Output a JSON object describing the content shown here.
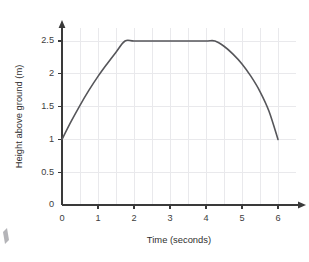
{
  "chart_data": {
    "type": "line",
    "title": "",
    "xlabel": "Time (seconds)",
    "ylabel": "Height above ground (m)",
    "xlim": [
      0,
      6.5
    ],
    "ylim": [
      0,
      2.7
    ],
    "grid": true,
    "legend": false,
    "x_ticks": [
      0,
      1,
      2,
      3,
      4,
      5,
      6
    ],
    "x_tick_labels": [
      "0",
      "1",
      "2",
      "3",
      "4",
      "5",
      "6"
    ],
    "y_ticks": [
      0,
      0.5,
      1,
      1.5,
      2,
      2.5
    ],
    "y_tick_labels": [
      "0",
      "0.5",
      "1",
      "1.5",
      "2",
      "2.5"
    ],
    "x_gridlines": [
      0.5,
      1,
      1.5,
      2,
      2.5,
      3,
      3.5,
      4,
      4.5,
      5,
      5.5,
      6
    ],
    "y_gridlines": [
      0.5,
      1,
      1.5,
      2,
      2.5
    ],
    "series": [
      {
        "name": "Height above ground",
        "color": "#56565a",
        "x": [
          0,
          0.25,
          0.5,
          0.75,
          1.0,
          1.25,
          1.5,
          1.75,
          2.0,
          2.5,
          3.0,
          3.5,
          4.0,
          4.25,
          4.5,
          4.75,
          5.0,
          5.25,
          5.5,
          5.75,
          6.0
        ],
        "values": [
          1.0,
          1.27,
          1.52,
          1.75,
          1.96,
          2.15,
          2.33,
          2.5,
          2.5,
          2.5,
          2.5,
          2.5,
          2.5,
          2.5,
          2.42,
          2.3,
          2.15,
          1.96,
          1.73,
          1.43,
          1.0
        ]
      }
    ],
    "annotations": {
      "plateau_start_x": 1.75,
      "plateau_end_x": 4.25,
      "plateau_value": 2.5,
      "start_point": [
        0,
        1
      ],
      "end_point": [
        6,
        1
      ]
    }
  },
  "corner_mark": {
    "name": "page-crop-artifact"
  }
}
